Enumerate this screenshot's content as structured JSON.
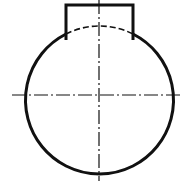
{
  "diagram": {
    "type": "technical-drawing",
    "colors": {
      "line": "#111111",
      "background": "#ffffff"
    },
    "circle": {
      "cx": 99,
      "cy": 95,
      "r": 74
    },
    "tab": {
      "left_x": 66,
      "right_x": 133,
      "top_y": 5,
      "leg_bottom_y": 40
    },
    "hidden_arc_label": "dashed hidden arc",
    "center_lines": {
      "horizontal": {
        "y": 95,
        "x1": 12,
        "x2": 181
      },
      "vertical": {
        "x": 99,
        "y1": 0,
        "y2": 181
      }
    }
  }
}
